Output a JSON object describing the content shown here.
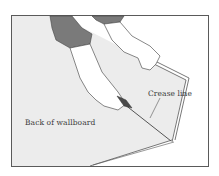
{
  "illustration": {
    "subject": "hands scoring and snapping wallboard along crease",
    "labels": {
      "back_of_wallboard": "Back of wallboard",
      "crease_line": "Crease line"
    },
    "colors": {
      "frame": "#5a5a5a",
      "board_fill": "#ececec",
      "sleeve": "#7a7a7a",
      "line": "#555555",
      "background": "#ffffff"
    }
  }
}
